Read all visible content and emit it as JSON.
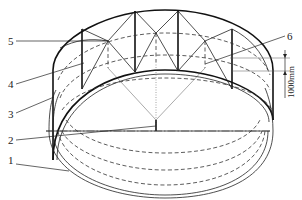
{
  "diagram": {
    "type": "technical-drawing",
    "labels": [
      {
        "id": "1",
        "text": "1"
      },
      {
        "id": "2",
        "text": "2"
      },
      {
        "id": "3",
        "text": "3"
      },
      {
        "id": "4",
        "text": "4"
      },
      {
        "id": "5",
        "text": "5"
      },
      {
        "id": "6",
        "text": "6"
      }
    ],
    "dimension": {
      "text": "1000mm"
    },
    "colors": {
      "line": "#111111",
      "background": "#ffffff"
    }
  }
}
